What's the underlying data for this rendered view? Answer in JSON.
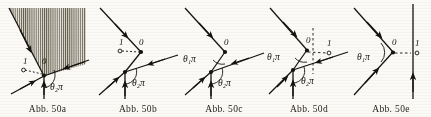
{
  "plate": {
    "type": "figure-plate",
    "source_style": "scanned textbook line drawings",
    "panel_count": 5,
    "ink_color": "#15130f",
    "paper_color": "#fbfaf7",
    "hatch_color": "#4a443a"
  },
  "panels": [
    {
      "id": "a",
      "caption": "Abb. 50a",
      "vertex_label": "0",
      "point_label": "1",
      "angle_label_left": "",
      "angle_label_right": "θ₂π",
      "has_hatched_region": true,
      "has_vertical_axis": false,
      "has_dashed_horizontal": true,
      "has_dashed_vertical": false,
      "hatch_direction": "vertical",
      "rays": [
        {
          "name": "upper-left-incoming",
          "direction": "down-right",
          "arrow": "mid"
        },
        {
          "name": "lower-left-incoming",
          "direction": "up-right",
          "arrow": "mid"
        },
        {
          "name": "right-outgoing",
          "direction": "up-right",
          "arrow": "mid"
        },
        {
          "name": "bottom-vertical",
          "direction": "up",
          "arrow": "mid"
        }
      ]
    },
    {
      "id": "b",
      "caption": "Abb. 50b",
      "vertex_label": "0",
      "point_label": "1",
      "angle_label_left": "",
      "angle_label_right": "θ₂π",
      "has_hatched_region": false,
      "has_vertical_axis": false,
      "has_dashed_horizontal": true,
      "has_dashed_vertical": false,
      "hatch_direction": "",
      "rays": [
        {
          "name": "upper-left-incoming",
          "direction": "down-right",
          "arrow": "mid"
        },
        {
          "name": "lower-left-incoming",
          "direction": "up-right",
          "arrow": "mid"
        },
        {
          "name": "right-incoming",
          "direction": "down-left",
          "arrow": "mid"
        },
        {
          "name": "bottom-vertical",
          "direction": "up",
          "arrow": "mid"
        }
      ]
    },
    {
      "id": "c",
      "caption": "Abb. 50c",
      "vertex_label": "0",
      "point_label": "",
      "angle_label_left": "θ₁π",
      "angle_label_right": "θ₂π",
      "has_hatched_region": false,
      "has_vertical_axis": false,
      "has_dashed_horizontal": false,
      "has_dashed_vertical": false,
      "hatch_direction": "",
      "rays": [
        {
          "name": "upper-left-incoming",
          "direction": "down-right",
          "arrow": "mid"
        },
        {
          "name": "lower-left-incoming",
          "direction": "up-right",
          "arrow": "mid"
        },
        {
          "name": "right-incoming",
          "direction": "down-left",
          "arrow": "mid"
        },
        {
          "name": "bottom-vertical",
          "direction": "up",
          "arrow": "mid"
        }
      ]
    },
    {
      "id": "d",
      "caption": "Abb. 50d",
      "vertex_label": "0",
      "point_label": "1",
      "angle_label_left": "θ₁π",
      "angle_label_right": "θ₂π",
      "has_hatched_region": false,
      "has_vertical_axis": false,
      "has_dashed_horizontal": true,
      "has_dashed_vertical": true,
      "hatch_direction": "",
      "rays": [
        {
          "name": "upper-left-incoming",
          "direction": "down-right",
          "arrow": "mid"
        },
        {
          "name": "lower-left-incoming",
          "direction": "up-right",
          "arrow": "mid"
        },
        {
          "name": "right-incoming",
          "direction": "down-left",
          "arrow": "mid"
        },
        {
          "name": "bottom-vertical",
          "direction": "up",
          "arrow": "mid"
        }
      ]
    },
    {
      "id": "e",
      "caption": "Abb. 50e",
      "vertex_label": "0",
      "point_label": "1",
      "angle_label_left": "θ₁π",
      "angle_label_right": "",
      "has_hatched_region": false,
      "has_vertical_axis": true,
      "has_dashed_horizontal": true,
      "has_dashed_vertical": false,
      "hatch_direction": "",
      "rays": [
        {
          "name": "upper-left-incoming",
          "direction": "down-right",
          "arrow": "mid"
        },
        {
          "name": "lower-left-incoming",
          "direction": "up-right",
          "arrow": "mid"
        },
        {
          "name": "right-vertical-axis",
          "direction": "up",
          "arrow": "mid"
        }
      ]
    }
  ]
}
